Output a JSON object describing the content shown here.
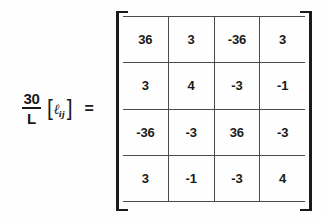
{
  "equation": {
    "coefficient": {
      "numerator": "30",
      "denominator": "L"
    },
    "matrix_symbol": {
      "open_bracket": "[",
      "base": "ℓ",
      "subscript": "ij",
      "close_bracket": "]"
    },
    "relation": "="
  },
  "matrix": {
    "rows": 4,
    "cols": 4,
    "values": [
      [
        "36",
        "3",
        "-36",
        "3"
      ],
      [
        "3",
        "4",
        "-3",
        "-1"
      ],
      [
        "-36",
        "-3",
        "36",
        "-3"
      ],
      [
        "3",
        "-1",
        "-3",
        "4"
      ]
    ]
  },
  "colors": {
    "ink": "#1a1a1a",
    "gridline": "#4a4a4a",
    "background": "#fefefe"
  }
}
